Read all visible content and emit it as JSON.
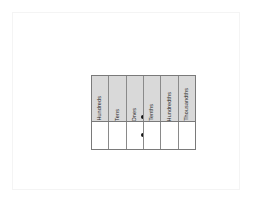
{
  "page": {
    "background_color": "#ffffff",
    "sheet_border_color": "#f4f4f4"
  },
  "chart": {
    "name": "place-value-chart",
    "border_color": "#7a7a7a",
    "header_fill": "#d9d9d9",
    "body_fill": "#ffffff",
    "columns": [
      {
        "label": "Hundreds",
        "value": ""
      },
      {
        "label": "Tens",
        "value": ""
      },
      {
        "label": "Ones",
        "value": ""
      },
      {
        "label": "Tenths",
        "value": ""
      },
      {
        "label": "Hundredths",
        "value": ""
      },
      {
        "label": "Thousandths",
        "value": ""
      }
    ],
    "decimal_point": {
      "name": "decimal-point",
      "between": "Ones / Tenths",
      "color": "#141414",
      "marks": 2
    }
  }
}
